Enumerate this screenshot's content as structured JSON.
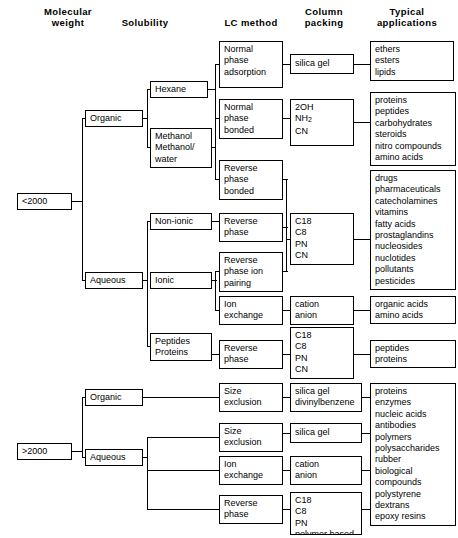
{
  "headers": [
    {
      "label": "Molecular\nweight",
      "x": 30,
      "y": 6,
      "w": 76
    },
    {
      "label": "Solubility",
      "x": 105,
      "y": 17,
      "w": 80
    },
    {
      "label": "LC  method",
      "x": 214,
      "y": 17,
      "w": 74
    },
    {
      "label": "Column\npacking",
      "x": 290,
      "y": 6,
      "w": 68
    },
    {
      "label": "Typical\napplications",
      "x": 362,
      "y": 6,
      "w": 90
    }
  ],
  "boxes": [
    {
      "name": "mw-under-2000",
      "text": "<2000",
      "x": 17,
      "y": 193,
      "w": 55,
      "h": 17
    },
    {
      "name": "mw-over-2000",
      "text": ">2000",
      "x": 17,
      "y": 443,
      "w": 55,
      "h": 17
    },
    {
      "name": "solubility-organic-low",
      "text": "Organic",
      "x": 85,
      "y": 110,
      "w": 58,
      "h": 17
    },
    {
      "name": "solubility-aqueous-low",
      "text": "Aqueous",
      "x": 85,
      "y": 272,
      "w": 58,
      "h": 17
    },
    {
      "name": "solvent-hexane",
      "text": "Hexane",
      "x": 150,
      "y": 81,
      "w": 58,
      "h": 17
    },
    {
      "name": "solvent-methanol",
      "text": "Methanol\nMethanol/\nwater",
      "x": 150,
      "y": 128,
      "w": 62,
      "h": 40
    },
    {
      "name": "ionicity-non-ionic",
      "text": "Non-ionic",
      "x": 150,
      "y": 213,
      "w": 62,
      "h": 17
    },
    {
      "name": "ionicity-ionic",
      "text": "Ionic",
      "x": 150,
      "y": 272,
      "w": 62,
      "h": 17
    },
    {
      "name": "analyte-peptides-proteins",
      "text": "Peptides\nProteins",
      "x": 150,
      "y": 333,
      "w": 62,
      "h": 28
    },
    {
      "name": "lc-normal-phase-adsorption",
      "text": "Normal\nphase\nadsorption",
      "x": 219,
      "y": 41,
      "w": 64,
      "h": 47
    },
    {
      "name": "lc-normal-phase-bonded",
      "text": "Normal\nphase\nbonded",
      "x": 219,
      "y": 99,
      "w": 64,
      "h": 40
    },
    {
      "name": "lc-reverse-phase-bonded",
      "text": "Reverse\nphase\nbonded",
      "x": 219,
      "y": 160,
      "w": 64,
      "h": 40
    },
    {
      "name": "lc-reverse-phase",
      "text": "Reverse\nphase",
      "x": 219,
      "y": 213,
      "w": 64,
      "h": 29
    },
    {
      "name": "lc-reverse-phase-ion-pairing",
      "text": "Reverse\nphase ion\npairing",
      "x": 219,
      "y": 252,
      "w": 64,
      "h": 40
    },
    {
      "name": "lc-ion-exchange",
      "text": "Ion\nexchange",
      "x": 219,
      "y": 296,
      "w": 64,
      "h": 29
    },
    {
      "name": "lc-reverse-phase-peptides",
      "text": "Reverse\nphase",
      "x": 219,
      "y": 340,
      "w": 64,
      "h": 29
    },
    {
      "name": "lc-size-exclusion-organic",
      "text": "Size\nexclusion",
      "x": 219,
      "y": 383,
      "w": 64,
      "h": 29
    },
    {
      "name": "lc-size-exclusion-aqueous",
      "text": "Size\nexclusion",
      "x": 219,
      "y": 423,
      "w": 64,
      "h": 29
    },
    {
      "name": "lc-ion-exchange-aqueous",
      "text": "Ion\nexchange",
      "x": 219,
      "y": 456,
      "w": 64,
      "h": 29
    },
    {
      "name": "lc-reverse-phase-aqueous",
      "text": "Reverse\nphase",
      "x": 219,
      "y": 495,
      "w": 64,
      "h": 29
    },
    {
      "name": "solubility-organic-high",
      "text": "Organic",
      "x": 85,
      "y": 389,
      "w": 58,
      "h": 17
    },
    {
      "name": "solubility-aqueous-high",
      "text": "Aqueous",
      "x": 85,
      "y": 449,
      "w": 58,
      "h": 17
    },
    {
      "name": "packing-silica-gel",
      "text": "silica gel",
      "x": 290,
      "y": 54,
      "w": 64,
      "h": 20
    },
    {
      "name": "packing-2oh-nh2-cn",
      "text": "",
      "x": 290,
      "y": 99,
      "w": 64,
      "h": 47,
      "html": "2OH\nNH<sub>2</sub>\nCN"
    },
    {
      "name": "packing-c18-c8-pn-cn",
      "text": "C18\nC8\nPN\nCN",
      "x": 290,
      "y": 213,
      "w": 64,
      "h": 52
    },
    {
      "name": "packing-cation-anion",
      "text": "cation\nanion",
      "x": 290,
      "y": 296,
      "w": 64,
      "h": 29
    },
    {
      "name": "packing-c18-peptides",
      "text": "C18\nC8\nPN\nCN",
      "x": 290,
      "y": 327,
      "w": 64,
      "h": 52
    },
    {
      "name": "packing-silica-divinylbenzene",
      "text": "silica gel\ndivinylbenzene",
      "x": 290,
      "y": 383,
      "w": 72,
      "h": 29
    },
    {
      "name": "packing-silica-gel-aqueous",
      "text": "silica gel",
      "x": 290,
      "y": 423,
      "w": 72,
      "h": 20
    },
    {
      "name": "packing-cation-anion-aqueous",
      "text": "cation\nanion",
      "x": 290,
      "y": 456,
      "w": 72,
      "h": 29
    },
    {
      "name": "packing-c18-polymer",
      "text": "C18\nC8\nPN\npolymer based",
      "x": 290,
      "y": 492,
      "w": 72,
      "h": 43
    },
    {
      "name": "apps-ethers-esters-lipids",
      "text": "ethers\nesters\nlipids",
      "x": 370,
      "y": 41,
      "w": 84,
      "h": 40
    },
    {
      "name": "apps-proteins-peptides",
      "text": "proteins\npeptides\ncarbohydrates\nsteroids\nnitro compounds\namino acids",
      "x": 370,
      "y": 92,
      "w": 86,
      "h": 74
    },
    {
      "name": "apps-drugs-pesticides",
      "text": "drugs\npharmaceuticals\ncatecholamines\nvitamins\nfatty  acids\nprostaglandins\nnucleosides\nnuclotides\npollutants\npesticides",
      "x": 370,
      "y": 170,
      "w": 86,
      "h": 120
    },
    {
      "name": "apps-organic-amino-acids",
      "text": "organic acids\namino acids",
      "x": 370,
      "y": 296,
      "w": 86,
      "h": 28
    },
    {
      "name": "apps-peptides-proteins",
      "text": "peptides\nproteins",
      "x": 370,
      "y": 340,
      "w": 86,
      "h": 28
    },
    {
      "name": "apps-biomolecules",
      "text": "proteins\nenzymes\nnucleic acids\nantibodies\npolymers\npolysaccharides\nrubber\nbiological\n  compounds\npolystyrene\ndextrans\nepoxy resins",
      "x": 370,
      "y": 383,
      "w": 86,
      "h": 143
    }
  ],
  "connectors": [
    {
      "name": "mw-low-stub",
      "o": "h",
      "x": 72,
      "y": 201,
      "len": 10
    },
    {
      "name": "mw-low-bus",
      "o": "v",
      "x": 82,
      "y": 118,
      "len": 163
    },
    {
      "name": "mw-low-to-organic",
      "o": "h",
      "x": 82,
      "y": 118,
      "len": 4
    },
    {
      "name": "mw-low-to-aqueous",
      "o": "h",
      "x": 82,
      "y": 280,
      "len": 4
    },
    {
      "name": "organic-stub",
      "o": "h",
      "x": 143,
      "y": 118,
      "len": 5
    },
    {
      "name": "organic-bus",
      "o": "v",
      "x": 147,
      "y": 89,
      "len": 59
    },
    {
      "name": "organic-to-hexane",
      "o": "h",
      "x": 147,
      "y": 89,
      "len": 4
    },
    {
      "name": "organic-to-methanol",
      "o": "h",
      "x": 147,
      "y": 147,
      "len": 4
    },
    {
      "name": "hexane-stub",
      "o": "h",
      "x": 208,
      "y": 89,
      "len": 8
    },
    {
      "name": "hexane-bus",
      "o": "v",
      "x": 215,
      "y": 64,
      "len": 55
    },
    {
      "name": "hexane-to-npa",
      "o": "h",
      "x": 215,
      "y": 64,
      "len": 5
    },
    {
      "name": "hexane-to-npb",
      "o": "h",
      "x": 215,
      "y": 118,
      "len": 5
    },
    {
      "name": "methanol-stub",
      "o": "h",
      "x": 212,
      "y": 147,
      "len": 4
    },
    {
      "name": "methanol-bus",
      "o": "v",
      "x": 215,
      "y": 118,
      "len": 62
    },
    {
      "name": "methanol-to-rpb",
      "o": "h",
      "x": 215,
      "y": 179,
      "len": 5
    },
    {
      "name": "npa-to-silica",
      "o": "h",
      "x": 283,
      "y": 64,
      "len": 8
    },
    {
      "name": "npb-to-packing",
      "o": "h",
      "x": 283,
      "y": 118,
      "len": 8
    },
    {
      "name": "silica-to-apps",
      "o": "h",
      "x": 354,
      "y": 64,
      "len": 17
    },
    {
      "name": "packing2oh-to-apps",
      "o": "h",
      "x": 354,
      "y": 122,
      "len": 17
    },
    {
      "name": "aqueous-stub",
      "o": "h",
      "x": 143,
      "y": 280,
      "len": 5
    },
    {
      "name": "aqueous-bus",
      "o": "v",
      "x": 147,
      "y": 221,
      "len": 126
    },
    {
      "name": "aqueous-to-nonionic",
      "o": "h",
      "x": 147,
      "y": 221,
      "len": 4
    },
    {
      "name": "aqueous-to-peptides",
      "o": "h",
      "x": 147,
      "y": 346,
      "len": 4
    },
    {
      "name": "nonionic-to-rp",
      "o": "h",
      "x": 212,
      "y": 221,
      "len": 8
    },
    {
      "name": "ionic-stub",
      "o": "h",
      "x": 212,
      "y": 280,
      "len": 5
    },
    {
      "name": "ionic-bus",
      "o": "v",
      "x": 215,
      "y": 271,
      "len": 40
    },
    {
      "name": "ionic-to-rpip",
      "o": "h",
      "x": 215,
      "y": 271,
      "len": 5
    },
    {
      "name": "ionic-to-ionex",
      "o": "h",
      "x": 215,
      "y": 310,
      "len": 5
    },
    {
      "name": "c18-bus",
      "o": "v",
      "x": 286,
      "y": 179,
      "len": 93
    },
    {
      "name": "rpb-to-bus",
      "o": "h",
      "x": 283,
      "y": 179,
      "len": 5
    },
    {
      "name": "rp-to-bus",
      "o": "h",
      "x": 283,
      "y": 227,
      "len": 5
    },
    {
      "name": "rpip-to-bus",
      "o": "h",
      "x": 283,
      "y": 271,
      "len": 5
    },
    {
      "name": "bus-to-c18",
      "o": "h",
      "x": 286,
      "y": 239,
      "len": 5
    },
    {
      "name": "c18-to-apps",
      "o": "h",
      "x": 354,
      "y": 239,
      "len": 17
    },
    {
      "name": "ionex-to-cation",
      "o": "h",
      "x": 283,
      "y": 310,
      "len": 8
    },
    {
      "name": "cation-to-apps",
      "o": "h",
      "x": 354,
      "y": 310,
      "len": 17
    },
    {
      "name": "peptides-to-rp",
      "o": "h",
      "x": 212,
      "y": 354,
      "len": 8
    },
    {
      "name": "rp-to-c18-peptides",
      "o": "h",
      "x": 283,
      "y": 354,
      "len": 8
    },
    {
      "name": "c18-peptides-to-apps",
      "o": "h",
      "x": 354,
      "y": 354,
      "len": 17
    },
    {
      "name": "mw-high-stub",
      "o": "h",
      "x": 72,
      "y": 451,
      "len": 10
    },
    {
      "name": "mw-high-bus",
      "o": "v",
      "x": 82,
      "y": 397,
      "len": 61
    },
    {
      "name": "mw-high-to-organic",
      "o": "h",
      "x": 82,
      "y": 397,
      "len": 4
    },
    {
      "name": "mw-high-to-aqueous",
      "o": "h",
      "x": 82,
      "y": 457,
      "len": 4
    },
    {
      "name": "organic-high-to-se",
      "o": "h",
      "x": 143,
      "y": 397,
      "len": 77
    },
    {
      "name": "aqueous-high-stub",
      "o": "h",
      "x": 143,
      "y": 457,
      "len": 5
    },
    {
      "name": "aqueous-high-bus",
      "o": "v",
      "x": 147,
      "y": 437,
      "len": 73
    },
    {
      "name": "aqueous-high-to-se",
      "o": "h",
      "x": 147,
      "y": 437,
      "len": 73
    },
    {
      "name": "aqueous-high-to-ionex",
      "o": "h",
      "x": 147,
      "y": 470,
      "len": 73
    },
    {
      "name": "aqueous-high-to-rp",
      "o": "h",
      "x": 147,
      "y": 509,
      "len": 73
    },
    {
      "name": "se-org-to-packing",
      "o": "h",
      "x": 283,
      "y": 397,
      "len": 8
    },
    {
      "name": "se-aq-to-packing",
      "o": "h",
      "x": 283,
      "y": 433,
      "len": 8
    },
    {
      "name": "ionex-aq-to-packing",
      "o": "h",
      "x": 283,
      "y": 470,
      "len": 8
    },
    {
      "name": "rp-aq-to-packing",
      "o": "h",
      "x": 283,
      "y": 509,
      "len": 8
    },
    {
      "name": "sd-to-apps",
      "o": "h",
      "x": 362,
      "y": 397,
      "len": 9
    },
    {
      "name": "sg-to-apps",
      "o": "h",
      "x": 362,
      "y": 433,
      "len": 9
    },
    {
      "name": "ca-to-apps",
      "o": "h",
      "x": 362,
      "y": 470,
      "len": 9
    },
    {
      "name": "c18p-to-apps",
      "o": "h",
      "x": 362,
      "y": 509,
      "len": 9
    }
  ]
}
